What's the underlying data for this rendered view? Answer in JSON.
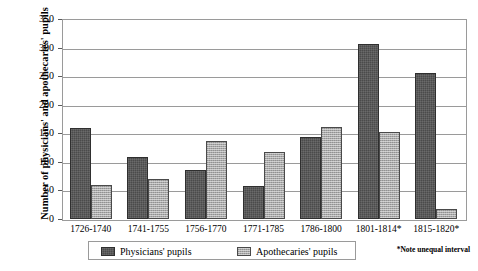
{
  "chart_data": {
    "type": "bar",
    "title": "",
    "xlabel": "",
    "ylabel": "Number of physicians' and apothecaries' pupils",
    "ylim": [
      0,
      350
    ],
    "yticks": [
      0,
      50,
      100,
      150,
      200,
      250,
      300,
      350
    ],
    "grid": true,
    "legend_position": "bottom",
    "categories": [
      "1726-1740",
      "1741-1755",
      "1756-1770",
      "1771-1785",
      "1786-1800",
      "1801-1814*",
      "1815-1820*"
    ],
    "series": [
      {
        "name": "Physicians' pupils",
        "color": "#4b4b4b",
        "values": [
          160,
          108,
          85,
          58,
          143,
          306,
          255
        ]
      },
      {
        "name": "Apothecaries' pupils",
        "color": "#a9a9a9",
        "values": [
          60,
          70,
          137,
          117,
          161,
          153,
          18
        ]
      }
    ],
    "annotations": [
      "*Note unequal interval"
    ]
  },
  "footnote": "*Note unequal interval"
}
